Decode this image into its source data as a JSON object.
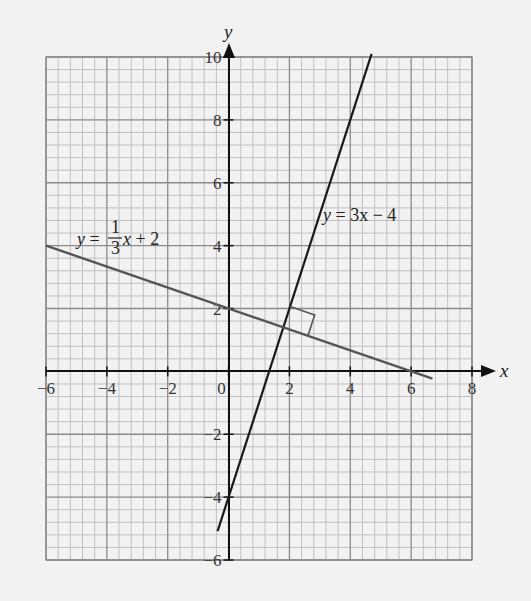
{
  "chart_data": {
    "type": "line",
    "title": "",
    "xlabel": "x",
    "ylabel": "y",
    "xlim": [
      -6,
      8
    ],
    "ylim": [
      -6,
      10
    ],
    "grid": true,
    "minor_grid_step": 0.4,
    "major_grid_step": 2,
    "x_ticks": [
      -6,
      -4,
      -2,
      0,
      2,
      4,
      6,
      8
    ],
    "y_ticks": [
      -6,
      -4,
      -2,
      2,
      4,
      6,
      8,
      10
    ],
    "x_tick_labels": [
      "−6",
      "−4",
      "−2",
      "0",
      "2",
      "4",
      "6",
      "8"
    ],
    "y_tick_labels": [
      "−6",
      "−4",
      "−2",
      "2",
      "4",
      "6",
      "8",
      "10"
    ],
    "series": [
      {
        "name": "y = 3x − 4",
        "label_parts": {
          "lhs": "y",
          "eq": " = ",
          "rhs": "3x − 4"
        },
        "slope": 3,
        "intercept": -4,
        "x_range": [
          -0.36,
          4.7
        ],
        "color": "#1a1a1a"
      },
      {
        "name": "y = 1/3 x + 2",
        "label_parts": {
          "lhs": "y",
          "eq": " = ",
          "num": "1",
          "den": "3",
          "var": "x",
          "rest": " + 2"
        },
        "slope": -0.3333,
        "intercept": 2,
        "x_range": [
          -6,
          6.7
        ],
        "color": "#555555"
      }
    ],
    "annotations": [
      {
        "type": "right-angle-marker",
        "at": [
          2,
          2
        ],
        "note": "perpendicular intersection marker"
      }
    ]
  },
  "labels": {
    "x_axis": "x",
    "y_axis": "y",
    "line1": {
      "y": "y",
      "eq": " = ",
      "rhs": "3x − 4"
    },
    "line2": {
      "y": "y",
      "eq": " = ",
      "num": "1",
      "den": "3",
      "x": "x",
      "rest": " + 2"
    }
  }
}
